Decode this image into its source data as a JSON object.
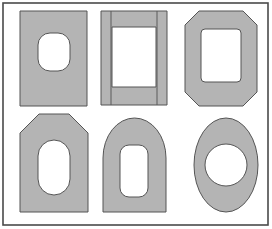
{
  "figure": {
    "canvas": {
      "width": 272,
      "height": 229
    },
    "background_color": "#ffffff",
    "frame": {
      "name": "outer-border",
      "x": 3,
      "y": 3,
      "width": 265,
      "height": 222,
      "stroke_color": "#4a4a4a",
      "stroke_width": 1.6
    },
    "style": {
      "fill_color": "#b4b4b4",
      "outline_color": "#555555",
      "outline_width": 1,
      "hole_color": "#ffffff",
      "seam_color": "#5a5a5a"
    },
    "shapes": [
      {
        "id": "shape-1",
        "label": "rectangle-with-squircle-hole",
        "outer_type": "rectangle",
        "hole_type": "rounded-square",
        "outer": {
          "x": 20,
          "y": 11,
          "width": 67,
          "height": 95,
          "rx": 0
        },
        "hole": {
          "x": 38,
          "y": 33,
          "width": 32,
          "height": 38,
          "rx": 12
        },
        "row": 1,
        "column": 1,
        "seams": []
      },
      {
        "id": "shape-2",
        "label": "rectangle-with-rectangular-hole-and-seams",
        "outer_type": "rectangle",
        "hole_type": "rectangle",
        "outer": {
          "x": 101,
          "y": 11,
          "width": 66,
          "height": 94,
          "rx": 0
        },
        "hole": {
          "x": 112,
          "y": 27,
          "width": 44,
          "height": 60,
          "rx": 0
        },
        "row": 1,
        "column": 2,
        "seams": [
          {
            "name": "left-seam",
            "x1": 111,
            "y1": 11,
            "x2": 111,
            "y2": 105
          },
          {
            "name": "right-seam",
            "x1": 157,
            "y1": 11,
            "x2": 157,
            "y2": 105
          }
        ]
      },
      {
        "id": "shape-3",
        "label": "octagon-with-rounded-rect-hole",
        "outer_type": "octagon",
        "hole_type": "rounded-rectangle",
        "outer": {
          "x": 185,
          "y": 11,
          "width": 72,
          "height": 95,
          "chamfer": 14
        },
        "hole": {
          "x": 201,
          "y": 29,
          "width": 40,
          "height": 53,
          "rx": 4
        },
        "row": 1,
        "column": 3,
        "seams": []
      },
      {
        "id": "shape-4",
        "label": "pentagon-with-stadium-hole",
        "outer_type": "pentagon-chamfered-top",
        "hole_type": "stadium",
        "outer": {
          "x": 20,
          "y": 114,
          "width": 68,
          "height": 98,
          "chamfer": 19
        },
        "hole": {
          "x": 38,
          "y": 140,
          "width": 32,
          "height": 55,
          "rx": 16
        },
        "row": 2,
        "column": 1,
        "seams": []
      },
      {
        "id": "shape-5",
        "label": "arch-with-rounded-rect-hole",
        "outer_type": "arch",
        "hole_type": "rounded-rectangle",
        "outer": {
          "x": 103,
          "y": 118,
          "width": 63,
          "height": 94,
          "arch_height": 40
        },
        "hole": {
          "x": 120,
          "y": 145,
          "width": 28,
          "height": 52,
          "rx": 9
        },
        "row": 2,
        "column": 2,
        "seams": []
      },
      {
        "id": "shape-6",
        "label": "ellipse-with-circular-hole",
        "outer_type": "ellipse",
        "hole_type": "circle",
        "outer": {
          "cx": 226,
          "cy": 165,
          "rx": 32,
          "ry": 47
        },
        "hole": {
          "cx": 226,
          "cy": 165,
          "rx": 21,
          "ry": 21
        },
        "row": 2,
        "column": 3,
        "seams": []
      }
    ]
  }
}
